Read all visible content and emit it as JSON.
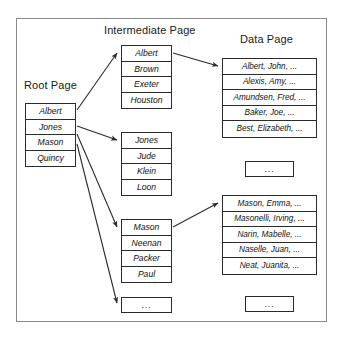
{
  "diagram": {
    "title_headings": {
      "root": "Root Page",
      "intermediate": "Intermediate Page",
      "data": "Data Page"
    },
    "ellipsis": "...",
    "root_page": {
      "entries": [
        "Albert",
        "Jones",
        "Mason",
        "Quincy"
      ]
    },
    "intermediate_pages": [
      {
        "entries": [
          "Albert",
          "Brown",
          "Exeter",
          "Houston"
        ]
      },
      {
        "entries": [
          "Jones",
          "Jude",
          "Klein",
          "Loon"
        ]
      },
      {
        "entries": [
          "Mason",
          "Neenan",
          "Packer",
          "Paul"
        ]
      }
    ],
    "intermediate_more": "...",
    "data_pages": [
      {
        "entries": [
          "Albert, John, ...",
          "Alexis, Amy, ...",
          "Amundsen, Fred, ...",
          "Baker, Joe, ...",
          "Best, Elizabeth, ..."
        ]
      },
      {
        "entries": [
          "Mason, Emma, ...",
          "Masonelli, Irving, ...",
          "Narin, Mabelle, ...",
          "Naselle, Juan, ...",
          "Neat, Juanita, ..."
        ]
      }
    ],
    "data_more": [
      "...",
      "..."
    ],
    "colors": {
      "frame_border": "#8a8a8a",
      "node_border": "#2b2b2b",
      "text": "#111111",
      "arrow": "#2b2b2b",
      "background": "#ffffff"
    }
  }
}
